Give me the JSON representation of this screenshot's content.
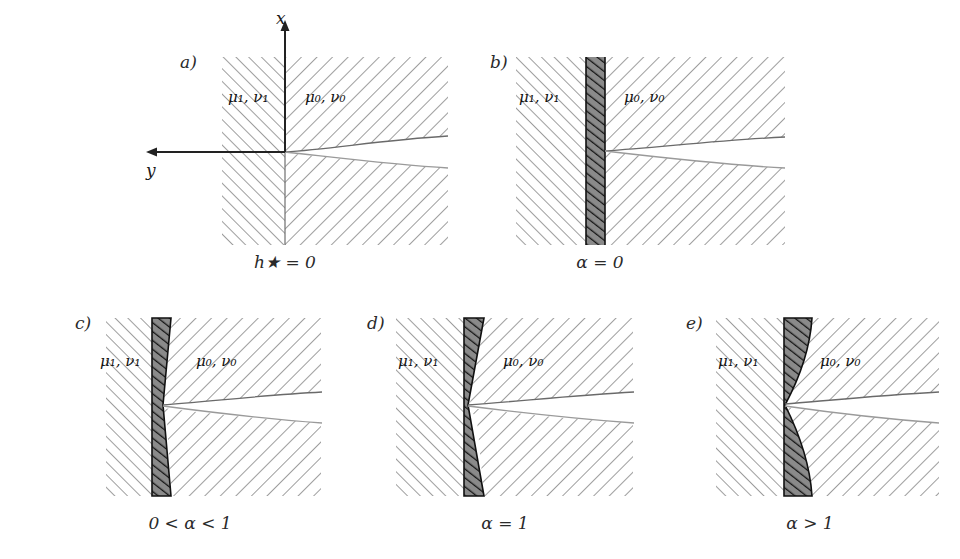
{
  "figure": {
    "type": "multi-panel-schematic",
    "background": "#ffffff",
    "hatch_color": "#8c8c8c",
    "band_fill": "#8a8a8a",
    "band_hatch_color": "#1a1a1a",
    "axis_color": "#222222",
    "curve_color": "#555555"
  },
  "material_labels": {
    "left": "μ₁, ν₁",
    "right": "μ₀, ν₀",
    "left_mu": "μ",
    "left_mu_sub": "1",
    "left_nu": "ν",
    "left_nu_sub": "1",
    "right_mu": "μ",
    "right_mu_sub": "0",
    "right_nu": "ν",
    "right_nu_sub": "0"
  },
  "axes": {
    "x_label": "x",
    "y_label": "y",
    "x_direction": "up",
    "y_direction": "left"
  },
  "panels": [
    {
      "id": "a",
      "label": "a)",
      "caption": "h★ = 0",
      "caption_symbol": "h",
      "caption_sub": "★",
      "caption_rel": "=",
      "caption_value": "0",
      "has_axes": true,
      "band": "none",
      "band_type": "interface-line",
      "left_material": "μ₁, ν₁",
      "right_material": "μ₀, ν₀"
    },
    {
      "id": "b",
      "label": "b)",
      "caption": "α = 0",
      "caption_symbol": "α",
      "caption_rel": "=",
      "caption_value": "0",
      "has_axes": false,
      "band": "uniform",
      "band_type": "constant-thickness",
      "left_material": "μ₁, ν₁",
      "right_material": "μ₀, ν₀"
    },
    {
      "id": "c",
      "label": "c)",
      "caption": "0 < α < 1",
      "caption_lhs": "0",
      "caption_rel1": "<",
      "caption_symbol": "α",
      "caption_rel2": "<",
      "caption_value": "1",
      "has_axes": false,
      "band": "pinched-partial",
      "band_type": "cusp-partial",
      "left_material": "μ₁, ν₁",
      "right_material": "μ₀, ν₀"
    },
    {
      "id": "d",
      "label": "d)",
      "caption": "α = 1",
      "caption_symbol": "α",
      "caption_rel": "=",
      "caption_value": "1",
      "has_axes": false,
      "band": "pinched-full",
      "band_type": "linear-taper-to-zero",
      "left_material": "μ₁, ν₁",
      "right_material": "μ₀, ν₀"
    },
    {
      "id": "e",
      "label": "e)",
      "caption": "α > 1",
      "caption_symbol": "α",
      "caption_rel": ">",
      "caption_value": "1",
      "has_axes": false,
      "band": "concave-lens",
      "band_type": "convex-outward-curved",
      "left_material": "μ₁, ν₁",
      "right_material": "μ₀, ν₀"
    }
  ]
}
